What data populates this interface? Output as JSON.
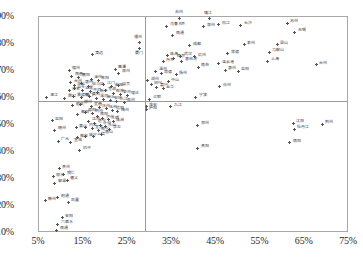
{
  "chart_data": {
    "type": "scatter",
    "title": "",
    "xlabel": "",
    "ylabel": "",
    "xlim": [
      5,
      75
    ],
    "ylim": [
      10,
      90
    ],
    "grid": false,
    "legend": "none",
    "xticks": [
      "5%",
      "15%",
      "25%",
      "35%",
      "45%",
      "55%",
      "65%",
      "75%"
    ],
    "yticks": [
      "90%",
      "80%",
      "70%",
      "60%",
      "50%",
      "40%",
      "30%",
      "20%",
      "10%"
    ],
    "xtick_values": [
      5,
      15,
      25,
      35,
      45,
      55,
      65,
      75
    ],
    "ytick_values": [
      90,
      80,
      70,
      60,
      50,
      40,
      30,
      20,
      10
    ],
    "reference_lines": {
      "vertical_x": 29.0,
      "horizontal_y": 59.0
    },
    "marker": "plus",
    "marker_color": "#555555",
    "axis_color": "#a8a8a8",
    "reference_line_color": "#9a9a9a",
    "points": [
      {
        "label": "湛江",
        "x": 6.8,
        "y": 60.2,
        "pos": "right"
      },
      {
        "label": "益阳",
        "x": 8.0,
        "y": 51.6,
        "pos": "right"
      },
      {
        "label": "随州",
        "x": 8.6,
        "y": 48.0,
        "pos": "right"
      },
      {
        "label": "广元",
        "x": 9.4,
        "y": 44.0,
        "pos": "right"
      },
      {
        "label": "贵州",
        "x": 9.6,
        "y": 33.8,
        "pos": "right"
      },
      {
        "label": "丽水",
        "x": 8.2,
        "y": 30.8,
        "pos": "right"
      },
      {
        "label": "铜仁",
        "x": 10.6,
        "y": 31.6,
        "pos": "right"
      },
      {
        "label": "黎温",
        "x": 8.6,
        "y": 28.4,
        "pos": "right"
      },
      {
        "label": "遵义",
        "x": 11.4,
        "y": 29.6,
        "pos": "right"
      },
      {
        "label": "赣州",
        "x": 6.4,
        "y": 22.0,
        "pos": "right"
      },
      {
        "label": "昭通",
        "x": 9.2,
        "y": 23.0,
        "pos": "right"
      },
      {
        "label": "凯里",
        "x": 11.6,
        "y": 21.4,
        "pos": "right"
      },
      {
        "label": "安阳",
        "x": 10.2,
        "y": 15.6,
        "pos": "right"
      },
      {
        "label": "六盘水",
        "x": 9.2,
        "y": 13.2,
        "pos": "right"
      },
      {
        "label": "南通",
        "x": 9.0,
        "y": 11.0,
        "pos": "right"
      },
      {
        "label": "巴中",
        "x": 14.2,
        "y": 40.6,
        "pos": "right"
      },
      {
        "label": "宣城",
        "x": 12.2,
        "y": 43.6,
        "pos": "right"
      },
      {
        "label": "雅安",
        "x": 13.6,
        "y": 45.2,
        "pos": "right"
      },
      {
        "label": "咸宁",
        "x": 15.6,
        "y": 45.6,
        "pos": "right"
      },
      {
        "label": "上饶",
        "x": 17.4,
        "y": 45.8,
        "pos": "right"
      },
      {
        "label": "黄山",
        "x": 13.4,
        "y": 49.0,
        "pos": "right"
      },
      {
        "label": "内江",
        "x": 15.6,
        "y": 49.2,
        "pos": "right"
      },
      {
        "label": "宜宾",
        "x": 17.0,
        "y": 48.6,
        "pos": "right"
      },
      {
        "label": "南宁",
        "x": 18.4,
        "y": 47.8,
        "pos": "right"
      },
      {
        "label": "眉山",
        "x": 19.2,
        "y": 46.6,
        "pos": "right"
      },
      {
        "label": "达州",
        "x": 16.2,
        "y": 51.4,
        "pos": "right"
      },
      {
        "label": "遂宁",
        "x": 17.6,
        "y": 50.6,
        "pos": "right"
      },
      {
        "label": "永州",
        "x": 18.8,
        "y": 50.0,
        "pos": "right"
      },
      {
        "label": "乐山",
        "x": 20.0,
        "y": 49.4,
        "pos": "right"
      },
      {
        "label": "崇左",
        "x": 21.0,
        "y": 48.4,
        "pos": "right"
      },
      {
        "label": "衡阳",
        "x": 13.8,
        "y": 54.0,
        "pos": "right"
      },
      {
        "label": "德阳",
        "x": 15.4,
        "y": 54.8,
        "pos": "right"
      },
      {
        "label": "荆州",
        "x": 17.0,
        "y": 54.4,
        "pos": "right"
      },
      {
        "label": "南阳",
        "x": 18.2,
        "y": 53.2,
        "pos": "right"
      },
      {
        "label": "泸州",
        "x": 19.4,
        "y": 52.4,
        "pos": "right"
      },
      {
        "label": "三明",
        "x": 20.6,
        "y": 52.0,
        "pos": "right"
      },
      {
        "label": "株洲",
        "x": 21.8,
        "y": 51.2,
        "pos": "right"
      },
      {
        "label": "韶关",
        "x": 12.6,
        "y": 57.2,
        "pos": "right"
      },
      {
        "label": "郴州",
        "x": 14.4,
        "y": 57.6,
        "pos": "right"
      },
      {
        "label": "宜昌",
        "x": 16.8,
        "y": 57.0,
        "pos": "right"
      },
      {
        "label": "抚州",
        "x": 18.6,
        "y": 56.4,
        "pos": "right"
      },
      {
        "label": "玉林",
        "x": 20.2,
        "y": 56.0,
        "pos": "right"
      },
      {
        "label": "信阳",
        "x": 21.6,
        "y": 55.4,
        "pos": "right"
      },
      {
        "label": "梅州",
        "x": 22.8,
        "y": 55.0,
        "pos": "right"
      },
      {
        "label": "周口",
        "x": 10.8,
        "y": 60.0,
        "pos": "right"
      },
      {
        "label": "景德镇",
        "x": 12.8,
        "y": 60.4,
        "pos": "right"
      },
      {
        "label": "荆门",
        "x": 14.6,
        "y": 60.2,
        "pos": "right"
      },
      {
        "label": "黄冈",
        "x": 16.4,
        "y": 60.6,
        "pos": "right"
      },
      {
        "label": "漯河",
        "x": 18.0,
        "y": 60.0,
        "pos": "right"
      },
      {
        "label": "商丘",
        "x": 19.6,
        "y": 59.6,
        "pos": "right"
      },
      {
        "label": "安庆",
        "x": 21.2,
        "y": 59.2,
        "pos": "right"
      },
      {
        "label": "九江",
        "x": 22.6,
        "y": 58.8,
        "pos": "right"
      },
      {
        "label": "滁州",
        "x": 24.2,
        "y": 58.4,
        "pos": "right"
      },
      {
        "label": "茂名",
        "x": 11.8,
        "y": 62.6,
        "pos": "right"
      },
      {
        "label": "汕头",
        "x": 13.0,
        "y": 63.4,
        "pos": "right"
      },
      {
        "label": "汕尾",
        "x": 14.8,
        "y": 62.8,
        "pos": "right"
      },
      {
        "label": "开封",
        "x": 16.6,
        "y": 62.4,
        "pos": "right"
      },
      {
        "label": "新乡",
        "x": 18.2,
        "y": 62.0,
        "pos": "right"
      },
      {
        "label": "芜湖",
        "x": 20.0,
        "y": 62.6,
        "pos": "right"
      },
      {
        "label": "蚌埠",
        "x": 21.8,
        "y": 61.8,
        "pos": "right"
      },
      {
        "label": "泰州",
        "x": 23.4,
        "y": 61.4,
        "pos": "right"
      },
      {
        "label": "宿迁",
        "x": 25.0,
        "y": 61.0,
        "pos": "right"
      },
      {
        "label": "台州",
        "x": 12.2,
        "y": 65.6,
        "pos": "right"
      },
      {
        "label": "龙岩",
        "x": 13.0,
        "y": 64.6,
        "pos": "right"
      },
      {
        "label": "惠州",
        "x": 14.6,
        "y": 65.2,
        "pos": "right"
      },
      {
        "label": "驻马店",
        "x": 16.2,
        "y": 64.4,
        "pos": "right"
      },
      {
        "label": "江门",
        "x": 19.6,
        "y": 65.0,
        "pos": "right"
      },
      {
        "label": "盐城",
        "x": 21.4,
        "y": 64.2,
        "pos": "right"
      },
      {
        "label": "自贡",
        "x": 23.0,
        "y": 64.6,
        "pos": "right"
      },
      {
        "label": "南昌",
        "x": 12.4,
        "y": 68.0,
        "pos": "right"
      },
      {
        "label": "襄阳",
        "x": 14.0,
        "y": 67.6,
        "pos": "right"
      },
      {
        "label": "漳州",
        "x": 16.8,
        "y": 67.0,
        "pos": "right"
      },
      {
        "label": "阜阳",
        "x": 18.4,
        "y": 66.6,
        "pos": "right"
      },
      {
        "label": "宿州",
        "x": 11.8,
        "y": 70.2,
        "pos": "right"
      },
      {
        "label": "鹰潭",
        "x": 22.2,
        "y": 70.6,
        "pos": "right"
      },
      {
        "label": "泉州",
        "x": 23.0,
        "y": 69.2,
        "pos": "right"
      },
      {
        "label": "清远",
        "x": 17.0,
        "y": 76.0,
        "pos": "right"
      },
      {
        "label": "福州",
        "x": 27.6,
        "y": 80.4,
        "pos": "top"
      },
      {
        "label": "厦门",
        "x": 27.8,
        "y": 78.2,
        "pos": "bot"
      },
      {
        "label": "湖州",
        "x": 29.6,
        "y": 66.4,
        "pos": "right"
      },
      {
        "label": "绍兴",
        "x": 30.4,
        "y": 65.0,
        "pos": "right"
      },
      {
        "label": "嘉兴",
        "x": 31.6,
        "y": 64.0,
        "pos": "right"
      },
      {
        "label": "金华",
        "x": 33.0,
        "y": 63.4,
        "pos": "right"
      },
      {
        "label": "合肥",
        "x": 30.0,
        "y": 59.6,
        "pos": "right"
      },
      {
        "label": "淮安",
        "x": 29.2,
        "y": 56.8,
        "pos": "right"
      },
      {
        "label": "庐阳",
        "x": 29.2,
        "y": 55.6,
        "pos": "right"
      },
      {
        "label": "温州",
        "x": 31.4,
        "y": 70.0,
        "pos": "right"
      },
      {
        "label": "常德",
        "x": 32.6,
        "y": 69.0,
        "pos": "right"
      },
      {
        "label": "中山",
        "x": 34.2,
        "y": 66.0,
        "pos": "right"
      },
      {
        "label": "扬州",
        "x": 36.0,
        "y": 68.6,
        "pos": "right"
      },
      {
        "label": "丹东",
        "x": 33.0,
        "y": 73.4,
        "pos": "right"
      },
      {
        "label": "南京",
        "x": 35.4,
        "y": 74.8,
        "pos": "right"
      },
      {
        "label": "珠海",
        "x": 34.0,
        "y": 75.6,
        "pos": "right"
      },
      {
        "label": "武汉",
        "x": 37.0,
        "y": 75.4,
        "pos": "right"
      },
      {
        "label": "杭州",
        "x": 40.2,
        "y": 75.2,
        "pos": "right"
      },
      {
        "label": "惠林湾",
        "x": 37.2,
        "y": 73.6,
        "pos": "right"
      },
      {
        "label": "成都",
        "x": 39.0,
        "y": 79.4,
        "pos": "right"
      },
      {
        "label": "南通",
        "x": 35.2,
        "y": 83.2,
        "pos": "right"
      },
      {
        "label": "乌鲁木齐",
        "x": 33.8,
        "y": 86.6,
        "pos": "right"
      },
      {
        "label": "苏州",
        "x": 36.8,
        "y": 89.6,
        "pos": "top"
      },
      {
        "label": "泉州",
        "x": 42.2,
        "y": 86.4,
        "pos": "right"
      },
      {
        "label": "松江",
        "x": 45.6,
        "y": 87.2,
        "pos": "right"
      },
      {
        "label": "镇江",
        "x": 43.4,
        "y": 89.4,
        "pos": "top"
      },
      {
        "label": "长沙",
        "x": 50.6,
        "y": 87.0,
        "pos": "right"
      },
      {
        "label": "苏州",
        "x": 61.0,
        "y": 87.6,
        "pos": "right"
      },
      {
        "label": "无锡",
        "x": 62.8,
        "y": 84.4,
        "pos": "right"
      },
      {
        "label": "泰州",
        "x": 51.4,
        "y": 79.8,
        "pos": "right"
      },
      {
        "label": "昆山",
        "x": 58.8,
        "y": 79.8,
        "pos": "right"
      },
      {
        "label": "马鞍山",
        "x": 57.0,
        "y": 77.0,
        "pos": "right"
      },
      {
        "label": "常德",
        "x": 47.6,
        "y": 76.4,
        "pos": "right"
      },
      {
        "label": "上海",
        "x": 56.6,
        "y": 73.6,
        "pos": "right"
      },
      {
        "label": "台州",
        "x": 67.6,
        "y": 72.4,
        "pos": "right"
      },
      {
        "label": "连云港",
        "x": 45.6,
        "y": 72.6,
        "pos": "right"
      },
      {
        "label": "惠州",
        "x": 47.0,
        "y": 70.2,
        "pos": "right"
      },
      {
        "label": "益阳",
        "x": 50.0,
        "y": 70.0,
        "pos": "right"
      },
      {
        "label": "南充",
        "x": 41.0,
        "y": 71.4,
        "pos": "right"
      },
      {
        "label": "徐州",
        "x": 45.8,
        "y": 64.2,
        "pos": "right"
      },
      {
        "label": "宁波",
        "x": 40.4,
        "y": 60.2,
        "pos": "right"
      },
      {
        "label": "九江",
        "x": 34.8,
        "y": 56.8,
        "pos": "right"
      },
      {
        "label": "郑州",
        "x": 40.8,
        "y": 50.0,
        "pos": "right"
      },
      {
        "label": "贵阳",
        "x": 40.8,
        "y": 41.4,
        "pos": "right"
      },
      {
        "label": "沈阳",
        "x": 62.4,
        "y": 50.6,
        "pos": "right"
      },
      {
        "label": "牡丹江",
        "x": 62.6,
        "y": 48.4,
        "pos": "right"
      },
      {
        "label": "荆州",
        "x": 69.0,
        "y": 50.2,
        "pos": "right"
      },
      {
        "label": "南阳",
        "x": 61.6,
        "y": 43.4,
        "pos": "right"
      }
    ]
  }
}
